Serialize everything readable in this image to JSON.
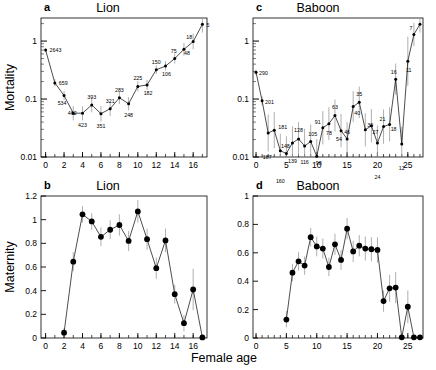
{
  "figure": {
    "xlabel": "Female age",
    "background": "#ffffff",
    "ink": "#000000",
    "errorbar_color": "#9a9a9a"
  },
  "panels": {
    "a": {
      "letter": "a",
      "title": "Lion",
      "ylabel": "Mortality",
      "yticks": [
        "0.01",
        "0.1",
        "1"
      ],
      "xticks": [
        "0",
        "2",
        "4",
        "6",
        "8",
        "10",
        "12",
        "14",
        "16"
      ]
    },
    "b": {
      "letter": "b",
      "title": "Lion",
      "ylabel": "Maternity",
      "yticks": [
        "0",
        "0.2",
        "0.4",
        "0.6",
        "0.8",
        "1",
        "1.2"
      ],
      "xticks": [
        "0",
        "2",
        "4",
        "6",
        "8",
        "10",
        "12",
        "14",
        "16"
      ]
    },
    "c": {
      "letter": "c",
      "title": "Baboon",
      "ylabel": "",
      "yticks": [
        "0.01",
        "0.1",
        "1"
      ],
      "xticks": [
        "0",
        "5",
        "10",
        "15",
        "20",
        "25"
      ]
    },
    "d": {
      "letter": "d",
      "title": "Baboon",
      "ylabel": "",
      "yticks": [
        "0",
        "0.2",
        "0.4",
        "0.6",
        "0.8",
        "1"
      ],
      "xticks": [
        "0",
        "5",
        "10",
        "15",
        "20",
        "25"
      ]
    }
  },
  "chart_data": [
    {
      "id": "a",
      "type": "line",
      "title": "Lion",
      "panel_letter": "a",
      "xlabel": "Female age",
      "ylabel": "Mortality",
      "yscale": "log",
      "ylim": [
        0.01,
        2.5
      ],
      "xlim": [
        -0.5,
        17.5
      ],
      "grid": false,
      "legend": "none",
      "x": [
        0,
        1,
        2,
        3,
        4,
        5,
        6,
        7,
        8,
        9,
        10,
        11,
        12,
        13,
        14,
        15,
        16,
        17
      ],
      "values": [
        0.7,
        0.19,
        0.115,
        0.057,
        0.057,
        0.079,
        0.056,
        0.068,
        0.105,
        0.083,
        0.165,
        0.175,
        0.32,
        0.37,
        0.5,
        0.72,
        0.98,
        1.95
      ],
      "point_labels": [
        "2643",
        "659",
        "534",
        "462",
        "423",
        "393",
        "351",
        "321",
        "283",
        "248",
        "225",
        "182",
        "150",
        "106",
        "75",
        "48",
        "18",
        "5"
      ],
      "point_label_meaning": "sample size n at each age",
      "err_low": [
        0.66,
        0.165,
        0.097,
        0.043,
        0.043,
        0.059,
        0.041,
        0.051,
        0.082,
        0.064,
        0.135,
        0.143,
        0.27,
        0.31,
        0.41,
        0.56,
        0.72,
        1.4
      ],
      "err_high": [
        0.74,
        0.22,
        0.137,
        0.075,
        0.075,
        0.105,
        0.076,
        0.091,
        0.135,
        0.108,
        0.202,
        0.215,
        0.38,
        0.45,
        0.61,
        0.93,
        1.34,
        2.45
      ]
    },
    {
      "id": "b",
      "type": "line",
      "title": "Lion",
      "panel_letter": "b",
      "xlabel": "Female age",
      "ylabel": "Maternity",
      "yscale": "linear",
      "ylim": [
        0,
        1.2
      ],
      "xlim": [
        -0.5,
        17.5
      ],
      "grid": false,
      "legend": "none",
      "x": [
        2,
        3,
        4,
        5,
        6,
        7,
        8,
        9,
        10,
        11,
        12,
        13,
        14,
        15,
        16,
        17
      ],
      "values": [
        0.045,
        0.645,
        1.045,
        0.985,
        0.855,
        0.915,
        0.955,
        0.82,
        1.07,
        0.835,
        0.59,
        0.825,
        0.37,
        0.125,
        0.41,
        0.005
      ],
      "err_low": [
        0.01,
        0.565,
        0.975,
        0.915,
        0.775,
        0.835,
        0.865,
        0.735,
        0.975,
        0.745,
        0.5,
        0.725,
        0.29,
        0.055,
        0.235,
        0.0
      ],
      "err_high": [
        0.085,
        0.725,
        1.115,
        1.055,
        0.935,
        0.995,
        1.045,
        0.905,
        1.165,
        0.925,
        0.68,
        0.925,
        0.45,
        0.195,
        0.585,
        0.02
      ]
    },
    {
      "id": "c",
      "type": "line",
      "title": "Baboon",
      "panel_letter": "c",
      "xlabel": "Female age",
      "ylabel": "Mortality",
      "yscale": "log",
      "ylim": [
        0.01,
        2.5
      ],
      "xlim": [
        -0.5,
        27.5
      ],
      "grid": false,
      "legend": "none",
      "x": [
        0,
        1,
        2,
        3,
        4,
        5,
        6,
        7,
        8,
        9,
        10,
        11,
        12,
        13,
        14,
        15,
        16,
        17,
        18,
        19,
        20,
        21,
        22,
        23,
        24,
        25,
        26,
        27
      ],
      "values": [
        0.29,
        0.093,
        0.026,
        0.029,
        0.0128,
        0.0115,
        0.0175,
        0.0205,
        0.0155,
        0.0185,
        0.0103,
        0.032,
        0.0375,
        0.052,
        0.0285,
        0.0205,
        0.074,
        0.088,
        0.0295,
        0.0345,
        0.0175,
        0.0335,
        0.0365,
        0.22,
        0.0167,
        0.45,
        1.3,
        1.95
      ],
      "point_labels": [
        "290",
        "201",
        "187",
        "181",
        "160",
        "148",
        "139",
        "128",
        "116",
        "105",
        "98",
        "91",
        "78",
        "63",
        "54",
        "46",
        "40",
        "35",
        "30",
        "27",
        "24",
        "21",
        "18",
        "16",
        "12",
        "11",
        "7",
        ""
      ],
      "point_label_meaning": "sample size n at each age",
      "err_low": [
        0.26,
        0.078,
        0.0125,
        0.0142,
        0.0065,
        0.0058,
        0.0091,
        0.0105,
        0.0078,
        0.0094,
        0.0052,
        0.0165,
        0.0195,
        0.0275,
        0.0148,
        0.0104,
        0.04,
        0.047,
        0.0152,
        0.0178,
        0.0088,
        0.0169,
        0.0186,
        0.118,
        0.0084,
        0.17,
        0.82,
        1.4
      ],
      "err_high": [
        0.32,
        0.111,
        0.054,
        0.06,
        0.0252,
        0.0228,
        0.0337,
        0.04,
        0.0308,
        0.0364,
        0.0204,
        0.062,
        0.072,
        0.098,
        0.055,
        0.04,
        0.137,
        0.164,
        0.057,
        0.067,
        0.0348,
        0.066,
        0.0717,
        0.41,
        0.0332,
        1.19,
        2.06,
        2.45
      ]
    },
    {
      "id": "d",
      "type": "line",
      "title": "Baboon",
      "panel_letter": "d",
      "xlabel": "Female age",
      "ylabel": "Maternity",
      "yscale": "linear",
      "ylim": [
        0,
        1
      ],
      "xlim": [
        -0.5,
        27.5
      ],
      "grid": false,
      "legend": "none",
      "x": [
        5,
        6,
        7,
        8,
        9,
        10,
        11,
        12,
        13,
        14,
        15,
        16,
        17,
        18,
        19,
        20,
        21,
        22,
        23,
        24,
        25,
        26,
        27
      ],
      "values": [
        0.13,
        0.46,
        0.54,
        0.51,
        0.71,
        0.645,
        0.63,
        0.5,
        0.66,
        0.55,
        0.77,
        0.61,
        0.65,
        0.63,
        0.625,
        0.62,
        0.26,
        0.35,
        0.355,
        0.005,
        0.22,
        0.005,
        0.005
      ],
      "err_low": [
        0.075,
        0.4,
        0.475,
        0.445,
        0.645,
        0.575,
        0.56,
        0.435,
        0.585,
        0.48,
        0.695,
        0.535,
        0.575,
        0.545,
        0.54,
        0.53,
        0.185,
        0.255,
        0.245,
        0.0,
        0.105,
        0.0,
        0.0
      ],
      "err_high": [
        0.19,
        0.52,
        0.605,
        0.575,
        0.775,
        0.715,
        0.7,
        0.565,
        0.735,
        0.62,
        0.845,
        0.685,
        0.725,
        0.715,
        0.71,
        0.71,
        0.335,
        0.445,
        0.465,
        0.02,
        0.335,
        0.02,
        0.02
      ]
    }
  ]
}
